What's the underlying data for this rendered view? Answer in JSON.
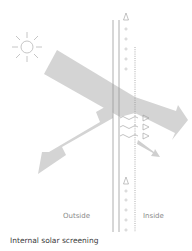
{
  "diagram": {
    "caption": "Internal solar screening",
    "labels": {
      "outside": "Outside",
      "inside": "Inside"
    },
    "colors": {
      "arrow_fill": "#d4d4d4",
      "line_color": "#9a9a9a",
      "sun_color": "#b8b8b8",
      "text_color": "#8a8a8a",
      "caption_color": "#3a3a3a"
    },
    "elements": [
      "sun-icon",
      "incident-radiation-arrow",
      "reflected-radiation-arrow",
      "transmitted-radiation-arrow",
      "absorbed-reradiated-arrow",
      "glazing-outer-pane",
      "glazing-inner-pane",
      "internal-screen-dotted-line",
      "airflow-circles",
      "heat-triangles",
      "longwave-squiggles"
    ]
  }
}
